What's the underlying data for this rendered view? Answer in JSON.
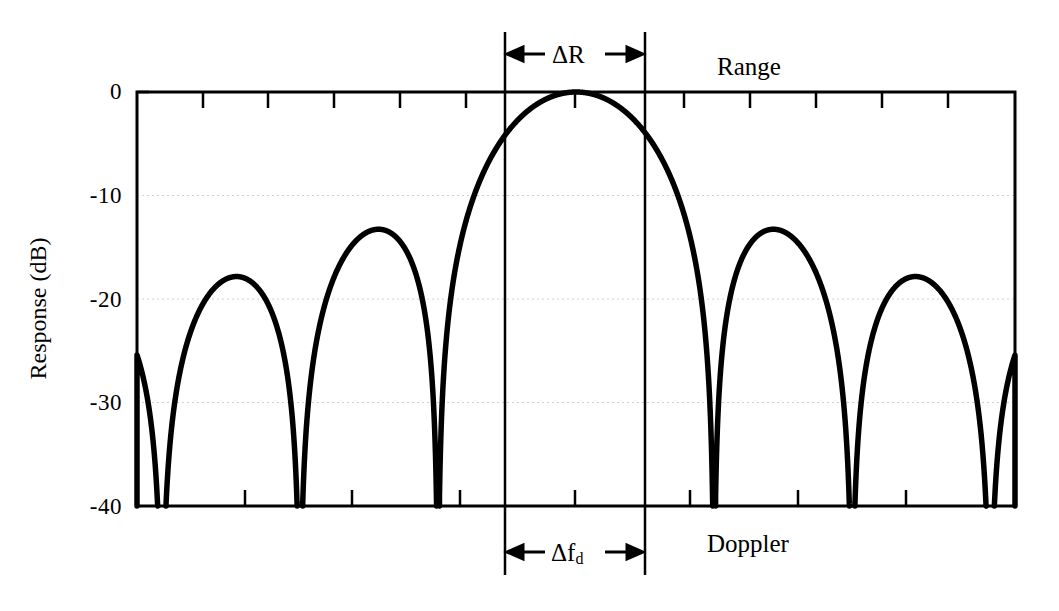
{
  "figure": {
    "title": "",
    "width": 1059,
    "height": 611,
    "background": "#ffffff",
    "line_color": "#000000",
    "grid_color": "#cccccc"
  },
  "axes": {
    "ylabel": "Response (dB)",
    "y_ticks": [
      "0",
      "-10",
      "-20",
      "-30",
      "-40"
    ],
    "y_tick_values": [
      0,
      -10,
      -20,
      -30,
      -40
    ],
    "x_ticks_visible": true,
    "x_tick_labels": []
  },
  "annotations": {
    "top_span_label": "ΔR",
    "top_left_arrow": "←",
    "top_right_arrow": "→",
    "bottom_span_label_main": "Δf",
    "bottom_span_label_sub": "d",
    "bottom_left_arrow": "←",
    "bottom_right_arrow": "→",
    "range_label": "Range",
    "doppler_label": "Doppler"
  },
  "chart_data": {
    "type": "line",
    "title": "",
    "xlabel": "",
    "ylabel": "Response (dB)",
    "xlim": [
      -3.18,
      3.18
    ],
    "ylim": [
      -40,
      0
    ],
    "grid": true,
    "grid_lines_y": [
      -10,
      -20,
      -30
    ],
    "legend": "none",
    "function": "20*log10(|sin(pi*x)/(pi*x)|)",
    "series": [
      {
        "name": "response",
        "x": [
          -3.18,
          -3.1,
          -3.0,
          -2.9,
          -2.8,
          -2.7,
          -2.6,
          -2.5,
          -2.4,
          -2.3,
          -2.2,
          -2.1,
          -2.0,
          -1.9,
          -1.8,
          -1.7,
          -1.6,
          -1.5,
          -1.4,
          -1.3,
          -1.2,
          -1.1,
          -1.0,
          -0.9,
          -0.8,
          -0.7,
          -0.6,
          -0.5,
          -0.4,
          -0.3,
          -0.2,
          -0.1,
          0.0,
          0.1,
          0.2,
          0.3,
          0.4,
          0.5,
          0.6,
          0.7,
          0.8,
          0.9,
          1.0,
          1.1,
          1.2,
          1.3,
          1.4,
          1.5,
          1.6,
          1.7,
          1.8,
          1.9,
          2.0,
          2.1,
          2.2,
          2.3,
          2.4,
          2.5,
          2.6,
          2.7,
          2.8,
          2.9,
          3.0,
          3.1,
          3.18
        ],
        "y": [
          -40.0,
          -34.5,
          -29.5,
          -25.7,
          -23.2,
          -21.6,
          -20.7,
          -20.4,
          -20.8,
          -21.8,
          -23.7,
          -27.0,
          -40.0,
          -27.5,
          -21.9,
          -18.6,
          -16.5,
          -15.3,
          -14.9,
          -15.4,
          -16.9,
          -20.0,
          -40.0,
          -21.1,
          -16.0,
          -12.9,
          -10.8,
          -9.3,
          -8.3,
          -7.6,
          -7.2,
          -7.0,
          0.0,
          -7.0,
          -7.2,
          -7.6,
          -8.3,
          -9.3,
          -10.8,
          -12.9,
          -16.0,
          -21.1,
          -40.0,
          -20.0,
          -16.9,
          -15.4,
          -14.9,
          -15.3,
          -16.5,
          -18.6,
          -21.9,
          -27.5,
          -40.0,
          -27.0,
          -23.7,
          -21.8,
          -20.8,
          -20.4,
          -20.7,
          -21.6,
          -23.2,
          -25.7,
          -29.5,
          -34.5,
          -40.0
        ]
      }
    ],
    "nulls_x": [
      -2.0,
      -1.0,
      1.0,
      2.0
    ],
    "peaks": [
      {
        "x": 0.0,
        "y_db": 0.0,
        "label": "main lobe"
      },
      {
        "x": -1.43,
        "y_db": -13.5,
        "label": "first sidelobe left"
      },
      {
        "x": 1.43,
        "y_db": -13.5,
        "label": "first sidelobe right"
      },
      {
        "x": -2.46,
        "y_db": -18.0,
        "label": "second sidelobe left"
      },
      {
        "x": 2.46,
        "y_db": -18.0,
        "label": "second sidelobe right"
      }
    ],
    "span_markers": {
      "delta_R_x": [
        -0.5,
        0.5
      ],
      "delta_fd_x": [
        -0.5,
        0.5
      ]
    }
  }
}
